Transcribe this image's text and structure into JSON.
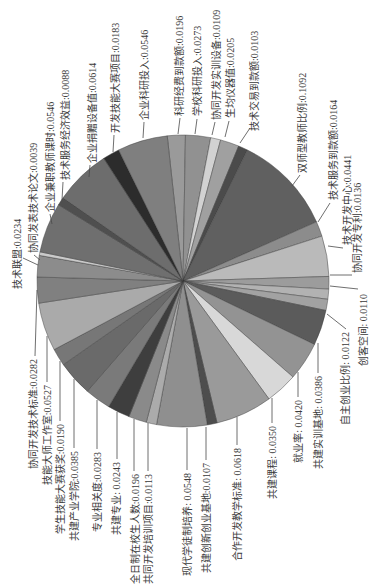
{
  "chart_data": {
    "type": "pie",
    "title": "",
    "legend": "none",
    "label_style": "rotated leader-line labels (name:weight)",
    "slices": [
      {
        "name": "科研经费到款额",
        "value": 0.0196,
        "label": "科研经费到款额:0.0196",
        "color": "#9a9a9a"
      },
      {
        "name": "学校科研投入",
        "value": 0.0273,
        "label": "学校科研投入:0.0273",
        "color": "#919191"
      },
      {
        "name": "协同开发实训设备",
        "value": 0.0109,
        "label": "协同开发实训设备:0.0109",
        "color": "#d2d2d2"
      },
      {
        "name": "生均仪器值",
        "value": 0.0205,
        "label": "生均仪器值:0.0205",
        "color": "#a0a0a0"
      },
      {
        "name": "技术交易到款额",
        "value": 0.0103,
        "label": "技术交易到款额:0.0103",
        "color": "#4b4b4b"
      },
      {
        "name": "双师型教师比例",
        "value": 0.1092,
        "label": "双师型教师比例:0.1092",
        "color": "#606060"
      },
      {
        "name": "技术服务到款额",
        "value": 0.0164,
        "label": "技术服务到款额:0.0164",
        "color": "#8c8c8c"
      },
      {
        "name": "技术开发中心",
        "value": 0.0441,
        "label": "技术开发中心:0.0441",
        "color": "#bababa"
      },
      {
        "name": "协同开发专利",
        "value": 0.0136,
        "label": "协同开发专利:0.0136",
        "color": "#9c9c9c"
      },
      {
        "name": "创客空间",
        "value": 0.011,
        "label": "创客空间: 0.0110",
        "color": "#b2b2b2"
      },
      {
        "name": "自主创业比例",
        "value": 0.0122,
        "label": "自主创业比例: 0.0122",
        "color": "#a2a2a2"
      },
      {
        "name": "共建实训基地",
        "value": 0.0386,
        "label": "共建实训基地: 0.0386",
        "color": "#5b5b5b"
      },
      {
        "name": "就业率",
        "value": 0.042,
        "label": "就业率: 0.0420",
        "color": "#939393"
      },
      {
        "name": "共建课程",
        "value": 0.035,
        "label": "共建课程: 0.0350",
        "color": "#d8d8d8"
      },
      {
        "name": "合作开发教学标准",
        "value": 0.0618,
        "label": "合作开发教学标准: 0.0618",
        "color": "#9a9a9a"
      },
      {
        "name": "共建创新创业基地",
        "value": 0.0107,
        "label": "共建创新创业基地:0.0107",
        "color": "#4d4d4d"
      },
      {
        "name": "现代学徒制培养",
        "value": 0.0548,
        "label": "现代学徒制培养: 0.0548",
        "color": "#8f8f8f"
      },
      {
        "name": "共同开发培训项目",
        "value": 0.0113,
        "label": "共同开发培训项目:0.0113",
        "color": "#ababab"
      },
      {
        "name": "全日制在校生人数",
        "value": 0.0196,
        "label": "全日制在校生人数:0.0196",
        "color": "#8a8a8a"
      },
      {
        "name": "共建专业",
        "value": 0.0243,
        "label": "共建专业: 0.0243",
        "color": "#3e3e3e"
      },
      {
        "name": "专业相关度",
        "value": 0.0283,
        "label": "专业相关度:0.0283",
        "color": "#7a7a7a"
      },
      {
        "name": "共建产业学院",
        "value": 0.0385,
        "label": "共建产业学院:0.0385",
        "color": "#6a6a6a"
      },
      {
        "name": "学生技能大赛获奖",
        "value": 0.019,
        "label": "学生技能大赛获奖:0.0190",
        "color": "#777777"
      },
      {
        "name": "技能大师工作室",
        "value": 0.0527,
        "label": "技能大师工作室:0.0527",
        "color": "#aaaaaa"
      },
      {
        "name": "协同开发技术标准",
        "value": 0.0282,
        "label": "协同开发技术标准:0.0282",
        "color": "#808080"
      },
      {
        "name": "技术联盟",
        "value": 0.0234,
        "label": "技术联盟:0.0234",
        "color": "#8c8c8c"
      },
      {
        "name": "协同发表技术论文",
        "value": 0.0039,
        "label": "协同发表技术论文:0.0039",
        "color": "#cacaca"
      },
      {
        "name": "企业兼职教师课时",
        "value": 0.0546,
        "label": "企业兼职教师课时:0.0546",
        "color": "#6f6f6f"
      },
      {
        "name": "技术服务经济效益",
        "value": 0.0088,
        "label": "技术服务经济效益:0.0088",
        "color": "#4f4f4f"
      },
      {
        "name": "企业捐赠设备值",
        "value": 0.0614,
        "label": "企业捐赠设备值:0.0614",
        "color": "#6d6d6d"
      },
      {
        "name": "开发技能大赛项目",
        "value": 0.0183,
        "label": "开发技能大赛项目:0.0183",
        "color": "#2c2c2c"
      },
      {
        "name": "企业科研投入",
        "value": 0.0546,
        "label": "企业科研投入:0.0546",
        "color": "#7f7f7f"
      }
    ]
  }
}
